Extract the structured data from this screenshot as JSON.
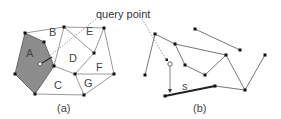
{
  "annotation": {
    "text": "query point"
  },
  "panel_a": {
    "caption": "(a)",
    "regions": [
      {
        "id": "A",
        "label": "A",
        "x": 30,
        "y": 53,
        "highlighted": true
      },
      {
        "id": "B",
        "label": "B",
        "x": 53,
        "y": 32
      },
      {
        "id": "C",
        "label": "C",
        "x": 58,
        "y": 87
      },
      {
        "id": "D",
        "label": "D",
        "x": 73,
        "y": 58
      },
      {
        "id": "E",
        "label": "E",
        "x": 90,
        "y": 31
      },
      {
        "id": "F",
        "label": "F",
        "x": 99,
        "y": 69
      },
      {
        "id": "G",
        "label": "G",
        "x": 88,
        "y": 83
      }
    ],
    "highlight_color": "#8c8c8c"
  },
  "panel_b": {
    "caption": "(b)",
    "segment_label": "s"
  }
}
